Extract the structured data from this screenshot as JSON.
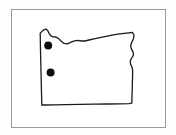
{
  "figure": {
    "background_color": "#fdfdfd",
    "frame": {
      "name": "figure-border",
      "x": 11,
      "y": 9,
      "width": 154,
      "height": 118,
      "stroke_color": "#9a9a9a",
      "stroke_width": 1,
      "fill_color": "#ffffff"
    }
  },
  "map": {
    "region_name": "Oregon",
    "outline_color": "#1a1a1a",
    "outline_width": 1.3,
    "fill_color": "#ffffff",
    "outline_path": "M 41.5 92.5 L 40.5 50.5 L 40.2 33.2 L 42.8 30.6 L 45.5 29.0 L 47.6 30.4 L 49.0 33.2 L 50.6 35.6 L 53.0 36.8 L 56.0 37.0 L 58.6 38.6 L 61.0 41.0 L 64.0 43.4 L 67.6 43.8 L 71.0 42.2 L 74.6 40.8 L 78.0 40.4 L 81.6 41.0 L 85.0 41.0 L 89.0 40.0 L 94.0 38.8 L 100.0 37.6 L 106.0 36.4 L 112.0 35.2 L 118.0 34.2 L 124.0 33.4 L 129.0 32.8 L 132.4 32.4 L 134.0 35.0 L 133.4 39.0 L 131.6 42.6 L 130.6 46.0 L 131.6 49.4 L 133.2 52.4 L 133.4 55.4 L 131.6 58.0 L 130.2 61.0 L 130.6 64.4 L 132.0 67.0 L 132.6 70.0 L 132.6 75.0 L 132.4 82.0 L 132.2 90.0 L 132.0 97.0 L 131.8 103.2 L 129.0 103.6 L 120.0 103.8 L 108.0 104.0 L 94.0 104.2 L 80.0 104.4 L 66.0 104.6 L 54.0 104.8 L 45.0 105.0 L 41.8 105.0 Z",
    "markers": [
      {
        "name": "location-marker-1",
        "cx": 48.2,
        "cy": 45.6,
        "r": 4.0,
        "color": "#0d0d0d"
      },
      {
        "name": "location-marker-2",
        "cx": 50.6,
        "cy": 72.4,
        "r": 4.0,
        "color": "#0d0d0d"
      }
    ]
  }
}
